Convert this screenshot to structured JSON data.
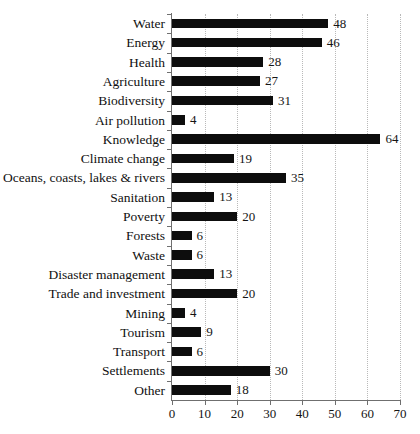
{
  "chart_data": {
    "type": "bar",
    "orientation": "horizontal",
    "title": "",
    "xlabel": "",
    "ylabel": "",
    "xlim": [
      0,
      70
    ],
    "xticks": [
      0,
      10,
      20,
      30,
      40,
      50,
      60,
      70
    ],
    "grid": "vertical-dotted",
    "legend": "none",
    "bar_color": "#0d0d0d",
    "show_value_labels": true,
    "categories": [
      "Water",
      "Energy",
      "Health",
      "Agriculture",
      "Biodiversity",
      "Air pollution",
      "Knowledge",
      "Climate change",
      "Oceans, coasts, lakes & rivers",
      "Sanitation",
      "Poverty",
      "Forests",
      "Waste",
      "Disaster management",
      "Trade and investment",
      "Mining",
      "Tourism",
      "Transport",
      "Settlements",
      "Other"
    ],
    "values": [
      48,
      46,
      28,
      27,
      31,
      4,
      64,
      19,
      35,
      13,
      20,
      6,
      6,
      13,
      20,
      4,
      9,
      6,
      30,
      18
    ]
  }
}
